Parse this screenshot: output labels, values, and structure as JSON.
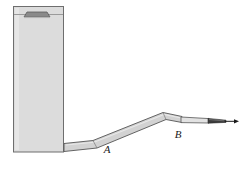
{
  "figure": {
    "type": "engineering-line-diagram",
    "background_color": "#ffffff",
    "canvas": {
      "width": 241,
      "height": 170
    }
  },
  "colors": {
    "outline": "#555555",
    "fill_light": "#dcdcdc",
    "fill_pipe": "#d2d2d2",
    "fill_dark": "#8a8a8a",
    "nozzle_dark": "#3c3c3c",
    "jet": "#1a1a1a",
    "label": "#1a1a1a"
  },
  "tank": {
    "name": "reservoir-tank",
    "left": 13,
    "right": 64,
    "top": 6,
    "bottom": 152,
    "surface_line_y": 14,
    "fill_color": "#dcdcdc"
  },
  "tank_cap": {
    "name": "tank-top-hatch",
    "color": "#8a8a8a",
    "top_left_x": 27,
    "top_right_x": 47,
    "bottom_left_x": 24,
    "bottom_right_x": 50,
    "top_y": 12,
    "bottom_y": 17
  },
  "pipe": {
    "name": "discharge-pipe",
    "fill_color": "#d2d2d2",
    "outline_color": "#555555",
    "segments": [
      {
        "name": "horizontal-outlet",
        "from_x": 64,
        "from_y": 148,
        "to_x": 92,
        "to_y": 144
      },
      {
        "name": "inclined-riser",
        "from_x": 92,
        "from_y": 144,
        "to_x": 163,
        "to_y": 116
      },
      {
        "name": "nozzle-neck",
        "from_x": 163,
        "from_y": 116,
        "to_x": 182,
        "to_y": 119
      }
    ]
  },
  "nozzle": {
    "name": "spray-nozzle",
    "barrel_from_x": 182,
    "barrel_to_x": 208,
    "barrel_y": 121,
    "tip_from_x": 208,
    "tip_to_x": 227,
    "color": "#3c3c3c"
  },
  "jet": {
    "name": "fluid-jet-arrow",
    "from_x": 227,
    "to_x": 238,
    "y": 121,
    "color": "#1a1a1a"
  },
  "labels": [
    {
      "id": "point-a",
      "text": "A",
      "x": 109,
      "y": 150,
      "style": "italic-serif"
    },
    {
      "id": "point-b",
      "text": "B",
      "x": 177,
      "y": 136,
      "style": "italic-serif"
    }
  ]
}
